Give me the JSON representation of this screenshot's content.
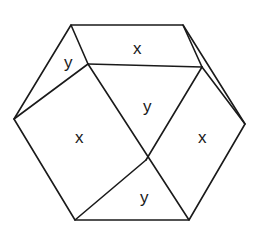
{
  "diagram": {
    "title": "",
    "type": "dissected hexagon",
    "stroke_color": "#1a1a1a",
    "background": "#ffffff",
    "vertices": {
      "top_left": [
        71,
        25
      ],
      "top_right": [
        183,
        25
      ],
      "right": [
        245,
        124
      ],
      "bottom_right": [
        189,
        220
      ],
      "bottom_left": [
        75,
        220
      ],
      "left": [
        14,
        119
      ],
      "inner_top_left": [
        88,
        64
      ],
      "inner_top_right": [
        202,
        67
      ],
      "center": [
        146,
        160
      ]
    },
    "regions": [
      {
        "id": "top-x",
        "label": "x",
        "pos": [
          137,
          49
        ]
      },
      {
        "id": "top-left-y",
        "label": "y",
        "pos": [
          68,
          64
        ]
      },
      {
        "id": "center-y",
        "label": "y",
        "pos": [
          148,
          108
        ]
      },
      {
        "id": "left-x",
        "label": "x",
        "pos": [
          80,
          142
        ]
      },
      {
        "id": "right-x",
        "label": "x",
        "pos": [
          203,
          142
        ]
      },
      {
        "id": "bottom-y",
        "label": "y",
        "pos": [
          144,
          200
        ]
      }
    ]
  }
}
